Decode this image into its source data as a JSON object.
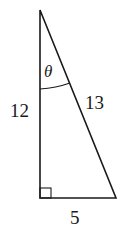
{
  "diagram": {
    "type": "right-triangle",
    "labels": {
      "angle": "θ",
      "vertical_leg": "12",
      "hypotenuse": "13",
      "horizontal_leg": "5"
    },
    "right_angle_marker": "bottom-left",
    "colors": {
      "stroke": "#1a1a1a",
      "background": "#ffffff"
    }
  }
}
